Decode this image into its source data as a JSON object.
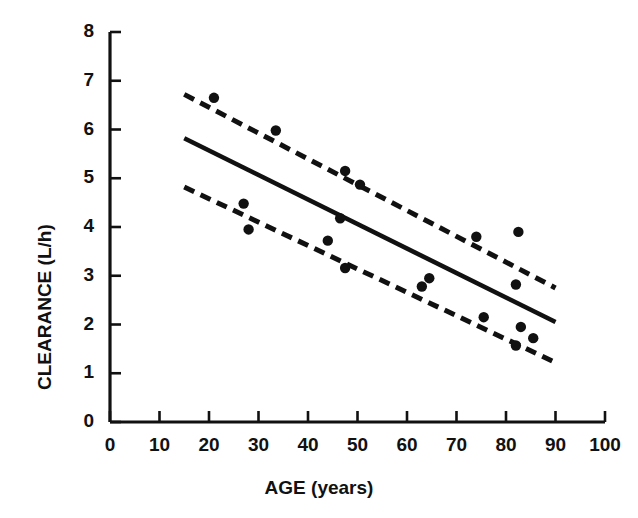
{
  "chart_data": {
    "type": "scatter",
    "title": "",
    "xlabel": "AGE (years)",
    "ylabel": "CLEARANCE (L/h)",
    "xlim": [
      0,
      100
    ],
    "ylim": [
      0,
      8
    ],
    "xticks": [
      0,
      10,
      20,
      30,
      40,
      50,
      60,
      70,
      80,
      90,
      100
    ],
    "yticks": [
      0,
      1,
      2,
      3,
      4,
      5,
      6,
      7,
      8
    ],
    "xtick_labels": [
      "0",
      "10",
      "20",
      "30",
      "40",
      "50",
      "60",
      "70",
      "80",
      "90",
      "100"
    ],
    "ytick_labels": [
      "0",
      "1",
      "2",
      "3",
      "4",
      "5",
      "6",
      "7",
      "8"
    ],
    "grid": false,
    "legend": false,
    "marker_color": "#111111",
    "line_color": "#111111",
    "points": [
      {
        "x": 21.0,
        "y": 6.65
      },
      {
        "x": 33.5,
        "y": 5.98
      },
      {
        "x": 27.0,
        "y": 4.48
      },
      {
        "x": 28.0,
        "y": 3.95
      },
      {
        "x": 47.5,
        "y": 5.15
      },
      {
        "x": 50.5,
        "y": 4.87
      },
      {
        "x": 46.5,
        "y": 4.18
      },
      {
        "x": 44.0,
        "y": 3.72
      },
      {
        "x": 47.5,
        "y": 3.16
      },
      {
        "x": 64.5,
        "y": 2.95
      },
      {
        "x": 63.0,
        "y": 2.78
      },
      {
        "x": 74.0,
        "y": 3.8
      },
      {
        "x": 82.5,
        "y": 3.9
      },
      {
        "x": 75.5,
        "y": 2.15
      },
      {
        "x": 82.0,
        "y": 2.82
      },
      {
        "x": 83.0,
        "y": 1.95
      },
      {
        "x": 85.5,
        "y": 1.72
      },
      {
        "x": 82.0,
        "y": 1.57
      }
    ],
    "series": [
      {
        "name": "regression-line",
        "style": "solid",
        "x": [
          15,
          90
        ],
        "y": [
          5.82,
          2.05
        ]
      },
      {
        "name": "upper-confidence-limit",
        "style": "dashed",
        "x": [
          15,
          90
        ],
        "y": [
          6.72,
          2.75
        ]
      },
      {
        "name": "lower-confidence-limit",
        "style": "dashed",
        "x": [
          15,
          90
        ],
        "y": [
          4.82,
          1.22
        ]
      }
    ]
  },
  "axes": {
    "x_title": "AGE (years)",
    "y_title": "CLEARANCE (L/h)"
  }
}
